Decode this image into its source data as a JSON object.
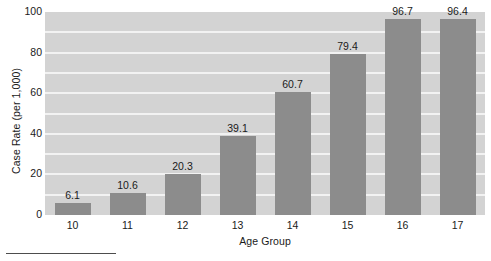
{
  "chart_data": {
    "type": "bar",
    "title": "",
    "subtitle": "",
    "xlabel": "Age Group",
    "ylabel": "Case Rate (per 1,000)",
    "categories": [
      "10",
      "11",
      "12",
      "13",
      "14",
      "15",
      "16",
      "17"
    ],
    "values": [
      6.1,
      10.6,
      20.3,
      39.1,
      60.7,
      79.4,
      96.7,
      96.4
    ],
    "value_labels": [
      "6.1",
      "10.6",
      "20.3",
      "39.1",
      "60.7",
      "79.4",
      "96.7",
      "96.4"
    ],
    "ylim": [
      0,
      100
    ],
    "y_ticks": [
      0,
      20,
      40,
      60,
      80,
      100
    ],
    "y_tick_labels": [
      "0",
      "20",
      "40",
      "60",
      "80",
      "100"
    ],
    "gridlines": [
      10,
      20,
      30,
      40,
      50,
      60,
      70,
      80,
      90
    ],
    "grid": true,
    "legend": null,
    "legend_position": "none",
    "annotations": []
  },
  "style": {
    "plot_background": "#d3d3d3",
    "bar_color": "#8c8c8c",
    "gridline_color": "#f2f2f2",
    "text_color": "#1a1a1a",
    "page_background": "#ffffff",
    "rule_color": "#4d4d4d"
  }
}
